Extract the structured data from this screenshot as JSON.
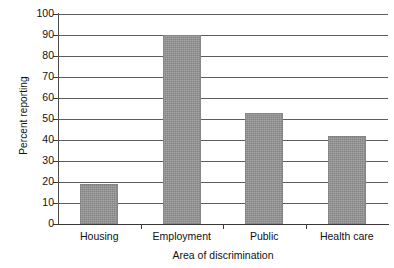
{
  "chart_data": {
    "type": "bar",
    "title": "",
    "xlabel": "Area of discrimination",
    "ylabel": "Percent reporting",
    "categories": [
      "Housing",
      "Employment",
      "Public",
      "Health care"
    ],
    "values": [
      19,
      90,
      53,
      42
    ],
    "ylim": [
      0,
      100
    ],
    "ytick_labels": [
      "0",
      "10",
      "20",
      "30",
      "40",
      "50",
      "60",
      "70",
      "80",
      "90",
      "100"
    ],
    "ytick_values": [
      0,
      10,
      20,
      30,
      40,
      50,
      60,
      70,
      80,
      90,
      100
    ],
    "grid": "horizontal",
    "legend": "none",
    "bar_color": "#919191",
    "gridline_color": "#5d5d5d",
    "axis_color": "#3a3a3a",
    "background_color": "#ffffff",
    "series": [
      {
        "name": "Percent reporting",
        "values": [
          19,
          90,
          53,
          42
        ]
      }
    ]
  }
}
